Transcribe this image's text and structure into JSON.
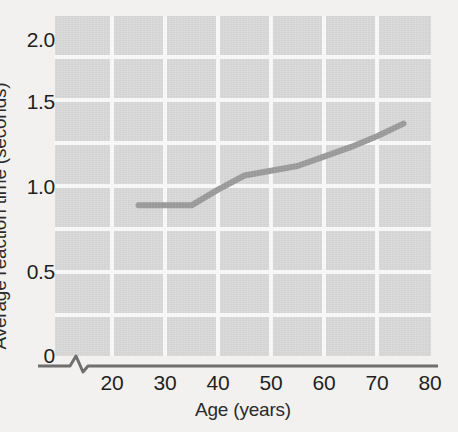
{
  "chart_data": {
    "type": "line",
    "title": "",
    "xlabel": "Age (years)",
    "ylabel": "Average reaction time (seconds)",
    "xlim": [
      20,
      80
    ],
    "ylim": [
      0,
      2.0
    ],
    "xticks": [
      "20",
      "30",
      "40",
      "50",
      "60",
      "70",
      "80"
    ],
    "xtick_values": [
      20,
      30,
      40,
      50,
      60,
      70,
      80
    ],
    "yticks": [
      "0",
      "0.5",
      "1.0",
      "1.5",
      "2.0"
    ],
    "ytick_values": [
      0,
      0.5,
      1.0,
      1.5,
      2.0
    ],
    "grid": true,
    "legend": null,
    "axis_break": "y-axis broken between 0 and lowest plotted region",
    "series": [
      {
        "name": "Average reaction time",
        "color": "#9a9a9a",
        "x": [
          25,
          30,
          35,
          40,
          45,
          50,
          55,
          60,
          65,
          70,
          75
        ],
        "values": [
          0.96,
          0.96,
          0.96,
          1.06,
          1.15,
          1.18,
          1.21,
          1.27,
          1.33,
          1.4,
          1.48
        ]
      }
    ]
  },
  "axes": {
    "y_title": "Average reaction time (seconds)",
    "x_title": "Age (years)"
  },
  "style": {
    "plot_background": "#d8d8d8",
    "page_background": "#f3f1ef",
    "gridline_color": "#fafafa",
    "line_color": "#9a9a9a",
    "text_color": "#1f1f1f",
    "axis_color": "#6f6f6f"
  }
}
